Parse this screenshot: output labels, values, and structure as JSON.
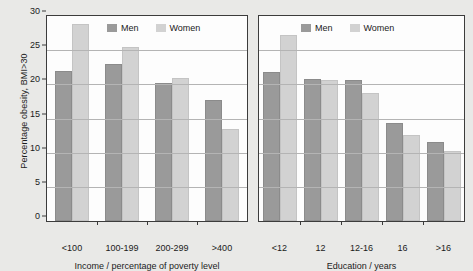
{
  "chart_data": [
    {
      "type": "bar",
      "title": "",
      "xlabel": "Income / percentage of poverty level",
      "ylabel": "Percentage obesity, BMI>30",
      "categories": [
        "<100",
        "100-199",
        "200-299",
        ">400"
      ],
      "series": [
        {
          "name": "Men",
          "values": [
            21.9,
            23.0,
            20.2,
            17.7
          ]
        },
        {
          "name": "Women",
          "values": [
            28.8,
            25.4,
            20.9,
            13.5
          ]
        }
      ],
      "ylim": [
        0,
        30
      ],
      "yticks": [
        0,
        5,
        10,
        15,
        20,
        25,
        30
      ],
      "grid": true,
      "legend_position": "top-center"
    },
    {
      "type": "bar",
      "title": "",
      "xlabel": "Education / years",
      "ylabel": "Percentage obesity, BMI>30",
      "categories": [
        "<12",
        "12",
        "12-16",
        "16",
        ">16"
      ],
      "series": [
        {
          "name": "Men",
          "values": [
            21.8,
            20.8,
            20.7,
            14.4,
            11.6
          ]
        },
        {
          "name": "Women",
          "values": [
            27.2,
            20.7,
            18.8,
            12.6,
            10.2
          ]
        }
      ],
      "ylim": [
        0,
        30
      ],
      "yticks": [
        0,
        5,
        10,
        15,
        20,
        25,
        30
      ],
      "grid": true,
      "legend_position": "top-center"
    }
  ],
  "axis": {
    "y_title": "Percentage obesity, BMI>30",
    "y_tick_labels": [
      "30",
      "25",
      "20",
      "15",
      "10",
      "5",
      "0"
    ]
  },
  "panels": {
    "income": {
      "x_title": "Income / percentage of poverty level",
      "x_tick_labels": [
        "<100",
        "100-199",
        "200-299",
        ">400"
      ],
      "legend": [
        {
          "label": "Men",
          "color": "#9a9a9a"
        },
        {
          "label": "Women",
          "color": "#d2d2d2"
        }
      ]
    },
    "education": {
      "x_title": "Education / years",
      "x_tick_labels": [
        "<12",
        "12",
        "12-16",
        "16",
        ">16"
      ],
      "legend": [
        {
          "label": "Men",
          "color": "#9a9a9a"
        },
        {
          "label": "Women",
          "color": "#d2d2d2"
        }
      ]
    }
  },
  "colors": {
    "men": "#9a9a9a",
    "women": "#d2d2d2",
    "background": "#e9e9e7",
    "plot_background": "#fdfdfd",
    "axis": "#3c3c3c",
    "gridline": "#b4b4b4"
  }
}
